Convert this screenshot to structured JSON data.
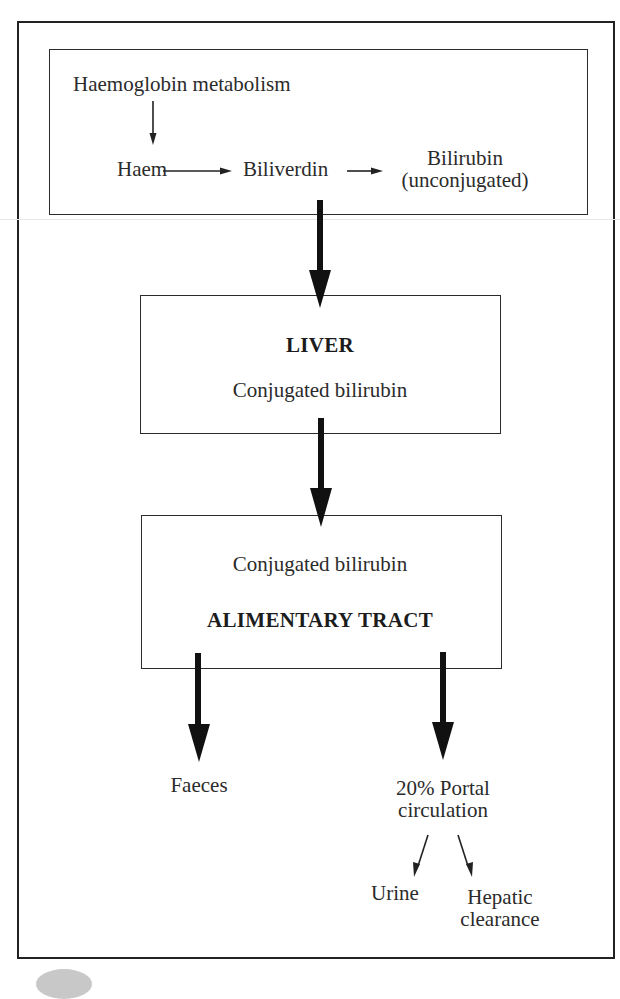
{
  "diagram": {
    "top_box": {
      "source_label": "Haemoglobin metabolism",
      "step_1": "Haem",
      "step_2": "Biliverdin",
      "step_3_line1": "Bilirubin",
      "step_3_line2": "(unconjugated)"
    },
    "liver_box": {
      "heading": "LIVER",
      "subtext": "Conjugated bilirubin"
    },
    "alimentary_box": {
      "subtext": "Conjugated bilirubin",
      "heading": "ALIMENTARY TRACT"
    },
    "outputs": {
      "faeces": "Faeces",
      "portal_line1": "20% Portal",
      "portal_line2": "circulation",
      "urine": "Urine",
      "hepatic_line1": "Hepatic",
      "hepatic_line2": "clearance"
    },
    "colors": {
      "line": "#222222",
      "text": "#2b2b2b",
      "background": "#ffffff"
    }
  }
}
